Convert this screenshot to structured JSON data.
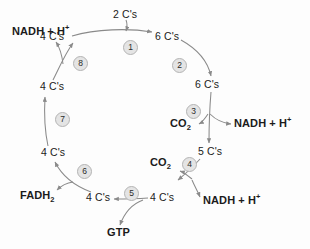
{
  "diagram": {
    "canvas": {
      "width": 310,
      "height": 249
    },
    "stroke_color": "#8a8a8a",
    "text_color": "#1b1b1b",
    "step_fill": "#e4e4e4",
    "step_border": "#b4b4b4"
  },
  "labels": {
    "acetyl_2c": "2 C's",
    "oxaloacetate_4c_top": "4 C's",
    "citrate_6c_top": "6 C's",
    "isocitrate_6c": "6 C's",
    "alpha_keto_5c": "5 C's",
    "succinyl_4c_right": "4 C's",
    "succinate_4c_bottom": "4 C's",
    "fumarate_4c_left_lower": "4 C's",
    "malate_4c_left_upper": "4 C's",
    "nadh_top_left": "NADH + H",
    "nadh_top_left_sup": "+",
    "nadh_right": "NADH + H",
    "nadh_right_sup": "+",
    "nadh_bottom_right": "NADH + H",
    "nadh_bottom_right_sup": "+",
    "co2_upper": "CO",
    "co2_upper_sub": "2",
    "co2_lower": "CO",
    "co2_lower_sub": "2",
    "fadh2": "FADH",
    "fadh2_sub": "2",
    "gtp": "GTP"
  },
  "steps": [
    {
      "id": 1,
      "label": "1"
    },
    {
      "id": 2,
      "label": "2"
    },
    {
      "id": 3,
      "label": "3"
    },
    {
      "id": 4,
      "label": "4"
    },
    {
      "id": 5,
      "label": "5"
    },
    {
      "id": 6,
      "label": "6"
    },
    {
      "id": 7,
      "label": "7"
    },
    {
      "id": 8,
      "label": "8"
    }
  ]
}
